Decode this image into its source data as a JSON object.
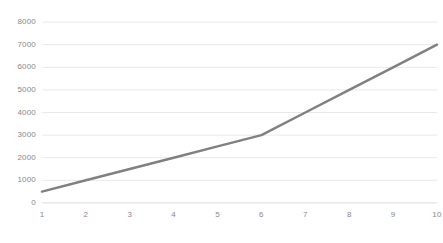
{
  "chart_data": {
    "type": "line",
    "title": "",
    "subtitle": "",
    "xlabel": "",
    "ylabel": "",
    "categories": [
      "1",
      "2",
      "3",
      "4",
      "5",
      "6",
      "7",
      "8",
      "9",
      "10"
    ],
    "x": [
      1,
      2,
      3,
      4,
      5,
      6,
      7,
      8,
      9,
      10
    ],
    "values": [
      500,
      1000,
      1500,
      2000,
      2500,
      3000,
      4000,
      5000,
      6000,
      7000
    ],
    "series": [
      {
        "name": "",
        "values": [
          500,
          1000,
          1500,
          2000,
          2500,
          3000,
          4000,
          5000,
          6000,
          7000
        ]
      }
    ],
    "ylim": [
      0,
      8000
    ],
    "xlim": [
      1,
      10
    ],
    "y_ticks": [
      0,
      1000,
      2000,
      3000,
      4000,
      5000,
      6000,
      7000,
      8000
    ],
    "y_tick_labels": [
      "0",
      "1000",
      "2000",
      "3000",
      "4000",
      "5000",
      "6000",
      "7000",
      "8000"
    ],
    "x_tick_labels": [
      "1",
      "2",
      "3",
      "4",
      "5",
      "6",
      "7",
      "8",
      "9",
      "10"
    ],
    "grid": {
      "horizontal": true,
      "vertical": false,
      "color": "#e8e8e8"
    },
    "legend": {
      "visible": false,
      "position": "none",
      "entries": []
    },
    "annotations": [],
    "style": {
      "background": "#ffffff",
      "line_color": "#808080",
      "line_width": 2.5,
      "markers": false,
      "axis_line_color": "#d9d9d9",
      "tick_label_color": "#888888"
    }
  }
}
